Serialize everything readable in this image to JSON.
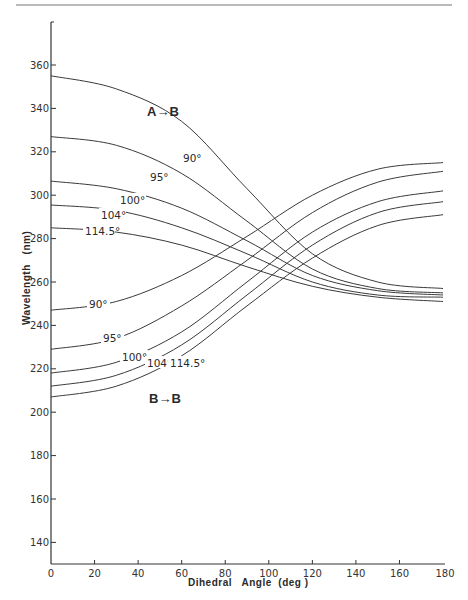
{
  "chart_data": {
    "type": "line",
    "title": "",
    "xlabel": "Dihedral Angle (deg)",
    "ylabel": "Wavelength (nm)",
    "xlim": [
      0,
      180
    ],
    "ylim": [
      130,
      375
    ],
    "xticks": [
      0,
      20,
      40,
      60,
      80,
      100,
      120,
      140,
      160,
      180
    ],
    "yticks": [
      140,
      160,
      180,
      200,
      220,
      240,
      260,
      280,
      300,
      320,
      340,
      360
    ],
    "grid": false,
    "annotations": [
      "A→B",
      "B→B"
    ],
    "series": [
      {
        "group": "A→B",
        "name": "90°",
        "x": [
          0,
          30,
          60,
          90,
          120,
          150,
          180
        ],
        "values": [
          355,
          349,
          334,
          303,
          273,
          260,
          257
        ]
      },
      {
        "group": "A→B",
        "name": "95°",
        "x": [
          0,
          30,
          60,
          90,
          120,
          150,
          180
        ],
        "values": [
          327,
          323,
          310,
          288,
          266,
          257,
          255
        ]
      },
      {
        "group": "A→B",
        "name": "100°",
        "x": [
          0,
          30,
          60,
          90,
          120,
          150,
          180
        ],
        "values": [
          306.5,
          303,
          294,
          279,
          263,
          256,
          254
        ]
      },
      {
        "group": "A→B",
        "name": "104°",
        "x": [
          0,
          30,
          60,
          90,
          120,
          150,
          180
        ],
        "values": [
          295.5,
          293,
          285,
          273,
          260,
          254,
          253
        ]
      },
      {
        "group": "A→B",
        "name": "114.5°",
        "x": [
          0,
          30,
          60,
          90,
          120,
          150,
          180
        ],
        "values": [
          285,
          283,
          277,
          267,
          258,
          253,
          251
        ]
      },
      {
        "group": "B→B",
        "name": "90°",
        "x": [
          0,
          30,
          60,
          90,
          120,
          150,
          180
        ],
        "values": [
          247,
          251,
          263,
          281,
          300,
          312,
          315
        ]
      },
      {
        "group": "B→B",
        "name": "95°",
        "x": [
          0,
          30,
          60,
          90,
          120,
          150,
          180
        ],
        "values": [
          229,
          234,
          249,
          270,
          292,
          306,
          311
        ]
      },
      {
        "group": "B→B",
        "name": "100°",
        "x": [
          0,
          30,
          60,
          90,
          120,
          150,
          180
        ],
        "values": [
          218,
          223,
          237,
          260,
          283,
          297,
          302
        ]
      },
      {
        "group": "B→B",
        "name": "104°",
        "x": [
          0,
          30,
          60,
          90,
          120,
          150,
          180
        ],
        "values": [
          212,
          217,
          231,
          254,
          277,
          292,
          297
        ]
      },
      {
        "group": "B→B",
        "name": "114.5°",
        "x": [
          0,
          30,
          60,
          90,
          120,
          150,
          180
        ],
        "values": [
          207,
          212,
          226,
          249,
          271,
          286,
          291
        ]
      }
    ]
  },
  "labels": {
    "group_ab": "A→B",
    "group_bb": "B→B",
    "ab": [
      "90°",
      "95°",
      "100°",
      "104°",
      "114.5°"
    ],
    "bb": [
      "90°",
      "95°",
      "100°",
      "104°",
      "114.5°"
    ],
    "xlabel": "Dihedral   Angle  (deg )",
    "ylabel": "Wavelength   (nm)"
  }
}
